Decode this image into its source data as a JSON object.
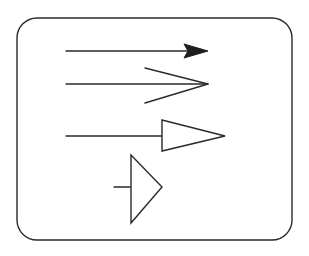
{
  "diagram": {
    "colors": {
      "ink": "#2a2a2a",
      "background": "#ffffff"
    },
    "frame": {
      "x": 17,
      "y": 18,
      "width": 275,
      "height": 222,
      "radius": 20
    },
    "arrows": [
      {
        "style": "filled-arrowhead",
        "line": {
          "x1": 66,
          "y1": 51,
          "x2": 200,
          "y2": 51
        },
        "head": [
          [
            208,
            51
          ],
          [
            184,
            44
          ],
          [
            188,
            51
          ],
          [
            184,
            58
          ]
        ]
      },
      {
        "style": "open-chevron-arrowhead",
        "line": {
          "x1": 66,
          "y1": 84,
          "x2": 208,
          "y2": 84
        },
        "head": [
          [
            145,
            68
          ],
          [
            208,
            84
          ],
          [
            145,
            103
          ]
        ]
      },
      {
        "style": "open-triangle-arrowhead",
        "line": {
          "x1": 66,
          "y1": 136,
          "x2": 162,
          "y2": 136
        },
        "head": [
          [
            162,
            120
          ],
          [
            225,
            136
          ],
          [
            162,
            151
          ]
        ]
      },
      {
        "style": "short-stub-large-triangle",
        "line": {
          "x1": 114,
          "y1": 187,
          "x2": 131,
          "y2": 187
        },
        "head": [
          [
            131,
            155
          ],
          [
            162,
            187
          ],
          [
            131,
            223
          ]
        ]
      }
    ]
  }
}
